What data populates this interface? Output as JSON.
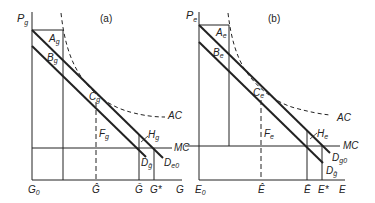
{
  "panels": [
    {
      "id": "a",
      "title": "(a)",
      "y_axis_label": "P",
      "y_axis_sub": "g",
      "x_axis_label": "G",
      "origin_label": "G",
      "origin_sub": "0",
      "x_ticks": [
        {
          "label": "Ĝ",
          "sub": ""
        },
        {
          "label": "Ḡ",
          "sub": ""
        },
        {
          "label": "G*",
          "sub": ""
        }
      ],
      "points": [
        {
          "label": "A",
          "sub": "g"
        },
        {
          "label": "B",
          "sub": "g"
        },
        {
          "label": "C",
          "sub": "g"
        },
        {
          "label": "F",
          "sub": "g"
        },
        {
          "label": "H",
          "sub": "g"
        }
      ],
      "curves": [
        {
          "label": "AC",
          "sub": ""
        },
        {
          "label": "MC",
          "sub": ""
        },
        {
          "label": "D",
          "sub": "ḡ"
        },
        {
          "label": "D",
          "sub": "e0"
        }
      ]
    },
    {
      "id": "b",
      "title": "(b)",
      "y_axis_label": "P",
      "y_axis_sub": "e",
      "x_axis_label": "E",
      "origin_label": "E",
      "origin_sub": "0",
      "x_ticks": [
        {
          "label": "Ê",
          "sub": ""
        },
        {
          "label": "Ē",
          "sub": ""
        },
        {
          "label": "E*",
          "sub": ""
        }
      ],
      "points": [
        {
          "label": "A",
          "sub": "e"
        },
        {
          "label": "B",
          "sub": "e"
        },
        {
          "label": "C",
          "sub": "e"
        },
        {
          "label": "F",
          "sub": "e"
        },
        {
          "label": "H",
          "sub": "e"
        }
      ],
      "curves": [
        {
          "label": "AC",
          "sub": ""
        },
        {
          "label": "MC",
          "sub": ""
        },
        {
          "label": "D",
          "sub": "g0"
        },
        {
          "label": "D",
          "sub": "ḡ"
        }
      ]
    }
  ]
}
